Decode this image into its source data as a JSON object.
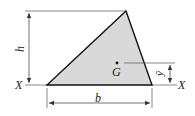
{
  "diagram": {
    "labels": {
      "axis_left": "X",
      "axis_right": "X",
      "height": "h",
      "base": "b",
      "centroid": "G",
      "centroid_distance": "ȳ"
    },
    "colors": {
      "fill": "#d9d9d9",
      "outline": "#111111",
      "dimension": "#333333"
    },
    "shape": {
      "type": "triangle",
      "vertices": [
        [
          47,
          85
        ],
        [
          152,
          85
        ],
        [
          126,
          11
        ]
      ]
    },
    "centroid_point": [
      117,
      63
    ]
  }
}
